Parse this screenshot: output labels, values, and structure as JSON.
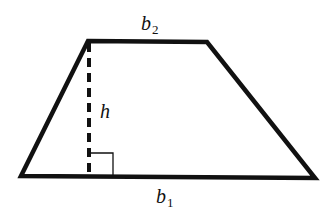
{
  "diagram": {
    "shape": "trapezoid",
    "colors": {
      "stroke": "#111111",
      "background": "#ffffff"
    },
    "vertices": {
      "top_left": [
        88,
        41
      ],
      "top_right": [
        207,
        42
      ],
      "bottom_right": [
        315,
        178
      ],
      "bottom_left": [
        21,
        176
      ]
    },
    "height_line": {
      "style": "dashed",
      "from": [
        89,
        41
      ],
      "to": [
        89,
        176
      ]
    },
    "right_angle_marker": {
      "corner": [
        89,
        176
      ],
      "size": 23
    },
    "labels": {
      "top_base": {
        "var": "b",
        "sub": "2"
      },
      "height": {
        "var": "h"
      },
      "bottom_base": {
        "var": "b",
        "sub": "1"
      }
    }
  }
}
